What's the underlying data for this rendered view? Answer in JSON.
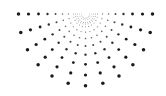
{
  "illustration": {
    "name": "half-sunburst-dot-pattern",
    "background": "#ffffff",
    "dot_color": "#1a1a1a",
    "center": {
      "x": 85.5,
      "y": 14
    },
    "angle_start_deg": 0,
    "angle_end_deg": 180,
    "ray_count": 13,
    "rings": [
      {
        "r": 4,
        "size": 0.45,
        "opacity": 0.35
      },
      {
        "r": 8,
        "size": 0.5,
        "opacity": 0.4
      },
      {
        "r": 12,
        "size": 0.55,
        "opacity": 0.45
      },
      {
        "r": 17,
        "size": 0.65,
        "opacity": 0.55
      },
      {
        "r": 23,
        "size": 0.8,
        "opacity": 0.65
      },
      {
        "r": 30,
        "size": 1.0,
        "opacity": 0.8
      },
      {
        "r": 38,
        "size": 1.2,
        "opacity": 0.9
      },
      {
        "r": 47,
        "size": 1.4,
        "opacity": 1
      },
      {
        "r": 57,
        "size": 1.6,
        "opacity": 1
      },
      {
        "r": 67,
        "size": 1.75,
        "opacity": 1
      }
    ],
    "inner_arcs": [
      {
        "r": 6,
        "dots": 9,
        "size": 0.45,
        "opacity": 0.45
      },
      {
        "r": 10,
        "dots": 13,
        "size": 0.5,
        "opacity": 0.45
      }
    ]
  }
}
